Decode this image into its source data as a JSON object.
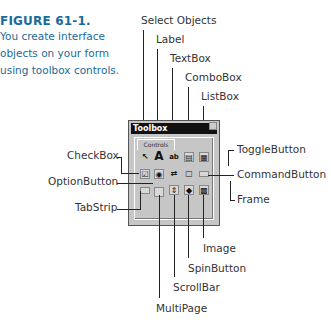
{
  "caption": {
    "title": "FIGURE 61-1.",
    "lines": [
      "You create interface",
      "objects on your form",
      "using toolbox controls."
    ]
  },
  "toolbox": {
    "title": "Toolbox",
    "tab": "Controls",
    "icons": {
      "select": "↖",
      "label": "A",
      "textbox": "ab",
      "combobox": "▤",
      "listbox": "▦",
      "checkbox": "☑",
      "option": "◉",
      "toggle": "⇄",
      "frame": "▢",
      "command": "▭",
      "tabstrip": "═",
      "multipage": "▣",
      "scrollbar": "⇕",
      "spin": "◆",
      "image": "▩"
    }
  },
  "callouts": {
    "select_objects": "Select Objects",
    "label": "Label",
    "textbox": "TextBox",
    "combobox": "ComboBox",
    "listbox": "ListBox",
    "checkbox": "CheckBox",
    "optionbutton": "OptionButton",
    "tabstrip": "TabStrip",
    "togglebutton": "ToggleButton",
    "commandbutton": "CommandButton",
    "frame": "Frame",
    "image": "Image",
    "spinbutton": "SpinButton",
    "scrollbar": "ScrollBar",
    "multipage": "MultiPage"
  }
}
